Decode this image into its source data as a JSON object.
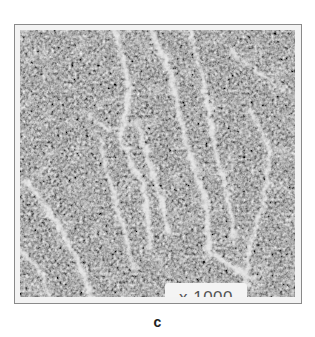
{
  "figure": {
    "image_description": "grayscale micrograph with light diagonal streaks on dark granular background",
    "magnification_label": "x 1000",
    "caption": "c",
    "colors": {
      "background_dark": "#4a4a4a",
      "streak_light": "#e8e8e8",
      "frame": "#8a8a8a"
    }
  }
}
